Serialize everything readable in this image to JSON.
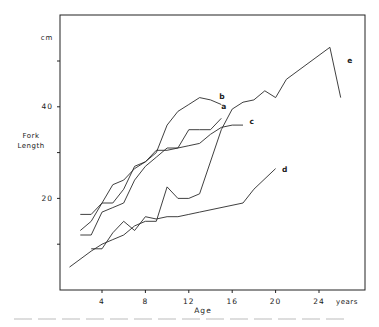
{
  "chart_data": {
    "type": "line",
    "title": "",
    "xlabel": "Age",
    "x_unit": "years",
    "ylabel": "Fork Length",
    "y_unit": "cm",
    "xlim": [
      0,
      28
    ],
    "ylim": [
      0,
      58
    ],
    "x_ticks": [
      4,
      8,
      12,
      16,
      20,
      24
    ],
    "x_tick_labels": [
      "4",
      "8",
      "12",
      "16",
      "20",
      "24"
    ],
    "y_ticks": [
      10,
      20,
      30,
      40,
      50
    ],
    "y_tick_labels": [
      "",
      "20",
      "",
      "40",
      ""
    ],
    "grid": false,
    "legend": "inline curve labels",
    "series": [
      {
        "name": "a",
        "x": [
          2,
          3,
          4,
          5,
          6,
          7,
          8,
          9,
          10,
          11,
          12,
          13,
          14,
          15
        ],
        "values": [
          12,
          12,
          17,
          18,
          19,
          24,
          27,
          29,
          31,
          31,
          35,
          35,
          35,
          37.5
        ]
      },
      {
        "name": "b",
        "x": [
          2,
          3,
          4,
          5,
          6,
          7,
          8,
          9,
          10,
          11,
          12,
          13,
          14,
          15
        ],
        "values": [
          13,
          15,
          19,
          23,
          24,
          26.5,
          28,
          30,
          36,
          39,
          40.5,
          42,
          41.5,
          40.5
        ]
      },
      {
        "name": "c",
        "x": [
          2,
          3,
          4,
          5,
          6,
          7,
          8,
          9,
          10,
          11,
          12,
          13,
          14,
          15,
          16,
          17
        ],
        "values": [
          16.5,
          16.5,
          19,
          19,
          22,
          27,
          28,
          30.5,
          30.5,
          31,
          31.5,
          32,
          34,
          35.5,
          36,
          36
        ]
      },
      {
        "name": "d",
        "x": [
          3,
          4,
          5,
          6,
          7,
          8,
          9,
          10,
          11,
          12,
          13,
          17,
          18,
          20
        ],
        "values": [
          9,
          9,
          12.5,
          15,
          13,
          16,
          15.5,
          16,
          16,
          16.5,
          17,
          19,
          22,
          26.5
        ]
      },
      {
        "name": "e",
        "x": [
          1,
          3,
          4,
          5,
          6,
          7,
          8,
          9,
          10,
          11,
          12,
          13,
          15,
          16,
          17,
          18,
          19,
          20,
          21,
          25,
          26
        ],
        "values": [
          5,
          8.5,
          10,
          11,
          12,
          14,
          15,
          15,
          22.5,
          20,
          20,
          21,
          35,
          39.5,
          41,
          41.5,
          43.5,
          42,
          46,
          53,
          42
        ]
      }
    ],
    "series_labels": [
      {
        "name": "a",
        "x": 15.0,
        "y": 39.5
      },
      {
        "name": "b",
        "x": 14.8,
        "y": 41.8
      },
      {
        "name": "c",
        "x": 17.6,
        "y": 36.3
      },
      {
        "name": "d",
        "x": 20.6,
        "y": 25.8
      },
      {
        "name": "e",
        "x": 26.6,
        "y": 49.5
      }
    ]
  },
  "labels": {
    "y_unit": "cm",
    "y_title_line1": "Fork",
    "y_title_line2": "Length",
    "x_title": "Age",
    "x_unit": "years"
  }
}
